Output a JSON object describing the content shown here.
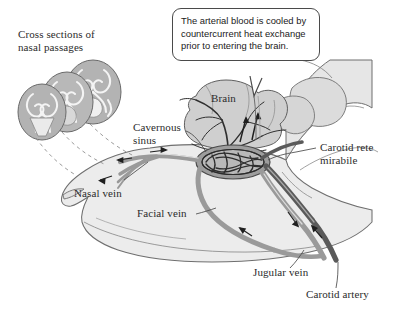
{
  "figure": {
    "background": "#ffffff"
  },
  "callout": {
    "text": "The arterial blood is cooled by countercurrent heat exchange prior to entering the brain.",
    "border_color": "#4a4a4a",
    "fill": "#ffffff"
  },
  "labels": {
    "cross_sections": "Cross sections of\nnasal passages",
    "cavernous_sinus": "Cavernous\nsinus",
    "brain": "Brain",
    "carotid_rete": "Carotid rete\nmirabile",
    "nasal_vein": "Nasal vein",
    "facial_vein": "Facial vein",
    "jugular_vein": "Jugular vein",
    "carotid_artery": "Carotid artery"
  },
  "colors": {
    "head_fill": "#ececec",
    "head_outline": "#6f6f6f",
    "cross_section_fill": "#b3b3b3",
    "cross_section_pattern": "#f2f2f2",
    "brain_fill": "#cfcfcf",
    "artery": "#5a5a5a",
    "vein": "#9a9a9a",
    "rete_mesh": "#3b3b3b",
    "vessel_thin": "#2f2f2f",
    "text": "#2b2b2b",
    "dashed_leader": "#8a8a8a"
  },
  "anatomy": {
    "structures": [
      "head profile",
      "nasal passage cross sections",
      "brain",
      "cavernous sinus",
      "carotid rete mirabile",
      "nasal vein",
      "facial vein",
      "jugular vein",
      "carotid artery",
      "ear",
      "neck"
    ],
    "flow_arrow_count": 7,
    "cross_section_count": 3
  }
}
